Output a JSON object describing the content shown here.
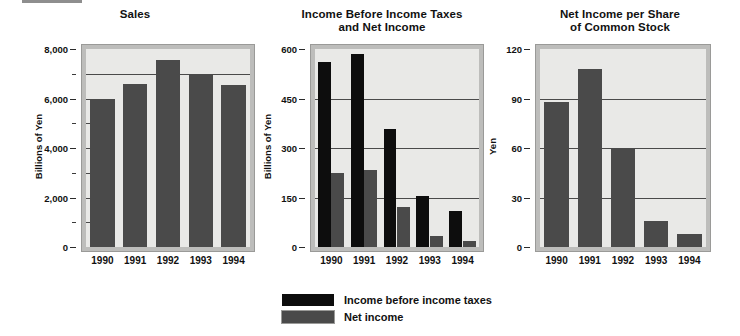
{
  "figure": {
    "decor_rule": "top-left-rule"
  },
  "legend": {
    "position": "bottom-center",
    "entries": [
      {
        "label": "Income before income taxes",
        "color": "#0d0d0d",
        "swatch": "black"
      },
      {
        "label": "Net income",
        "color": "#4a4a4a",
        "swatch": "dark"
      }
    ]
  },
  "chart_data": [
    {
      "type": "bar",
      "id": "sales",
      "title": "Sales",
      "title_line1": "Sales",
      "title_line2": "",
      "xlabel": "",
      "ylabel": "Billions of Yen",
      "categories": [
        "1990",
        "1991",
        "1992",
        "1993",
        "1994"
      ],
      "values": [
        6000,
        6600,
        7550,
        7000,
        6550
      ],
      "ylim": [
        0,
        8000
      ],
      "yticks": [
        0,
        2000,
        4000,
        6000,
        8000
      ],
      "ytick_labels": [
        "0",
        "2,000",
        "4,000",
        "6,000",
        "8,000"
      ],
      "yminor_step": 1000,
      "gridlines": [
        7000
      ],
      "grid": true,
      "bar_color": "#4a4a4a",
      "plot_bg": "#e9e9e7"
    },
    {
      "type": "bar",
      "id": "income",
      "title": "Income Before Income Taxes and Net Income",
      "title_line1": "Income Before Income Taxes",
      "title_line2": "and Net Income",
      "xlabel": "",
      "ylabel": "Billions of Yen",
      "categories": [
        "1990",
        "1991",
        "1992",
        "1993",
        "1994"
      ],
      "series": [
        {
          "name": "Income before income taxes",
          "color": "#0d0d0d",
          "values": [
            560,
            585,
            358,
            155,
            110
          ]
        },
        {
          "name": "Net income",
          "color": "#4a4a4a",
          "values": [
            225,
            232,
            122,
            34,
            18
          ]
        }
      ],
      "ylim": [
        0,
        600
      ],
      "yticks": [
        0,
        150,
        300,
        450,
        600
      ],
      "ytick_labels": [
        "0",
        "150",
        "300",
        "450",
        "600"
      ],
      "gridlines": [
        150,
        300,
        450
      ],
      "grid": true,
      "plot_bg": "#e9e9e7"
    },
    {
      "type": "bar",
      "id": "eps",
      "title": "Net Income per Share of Common Stock",
      "title_line1": "Net Income per Share",
      "title_line2": "of Common Stock",
      "xlabel": "",
      "ylabel": "Yen",
      "categories": [
        "1990",
        "1991",
        "1992",
        "1993",
        "1994"
      ],
      "values": [
        88,
        108,
        60,
        16,
        8
      ],
      "ylim": [
        0,
        120
      ],
      "yticks": [
        0,
        30,
        60,
        90,
        120
      ],
      "ytick_labels": [
        "0",
        "30",
        "60",
        "90",
        "120"
      ],
      "gridlines": [
        30,
        60,
        90
      ],
      "grid": true,
      "bar_color": "#4a4a4a",
      "plot_bg": "#e9e9e7"
    }
  ]
}
